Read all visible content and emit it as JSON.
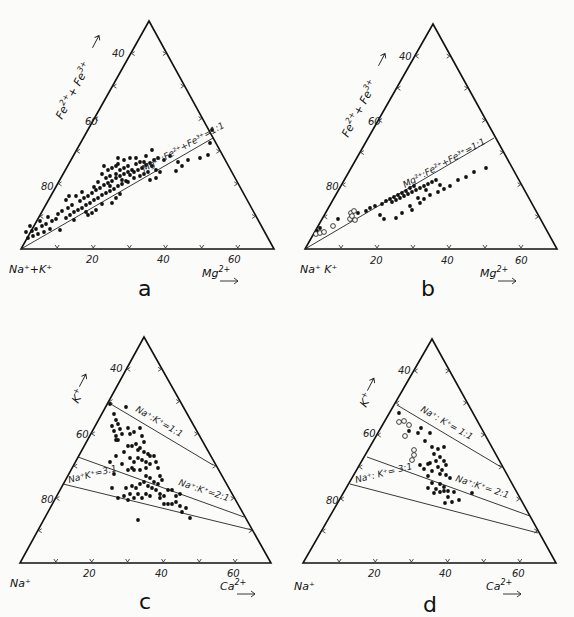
{
  "chart_data": [
    {
      "type": "scatter",
      "subtype": "ternary",
      "panel_label": "a",
      "vertices": {
        "bottom_left": "Na⁺+K⁺",
        "bottom_right": "Mg²⁺",
        "left_axis": "Fe²⁺+Fe³⁺"
      },
      "bottom_axis_label": "Mg²⁺",
      "left_axis_label": "Fe²⁺+Fe³⁺",
      "bottom_left_label": "Na⁺+K⁺",
      "bottom_ticks": [
        "20",
        "40",
        "60"
      ],
      "left_ticks": [
        "40",
        "60",
        "80"
      ],
      "reference_lines": [
        {
          "label": "Mg²⁺:Fe²⁺+Fe³⁺=1:1"
        }
      ],
      "series": [
        {
          "name": "samples",
          "marker": "filled",
          "count_approx": 120
        }
      ]
    },
    {
      "type": "scatter",
      "subtype": "ternary",
      "panel_label": "b",
      "bottom_axis_label": "Mg²⁺",
      "left_axis_label": "Fe²⁺+Fe³⁺",
      "bottom_left_label": "Na⁺  K⁺",
      "bottom_ticks": [
        "20",
        "40",
        "60"
      ],
      "left_ticks": [
        "40",
        "60",
        "80"
      ],
      "reference_lines": [
        {
          "label": "Mg²⁺:Fe²⁺+Fe³⁺=1:1"
        }
      ],
      "series": [
        {
          "name": "samples",
          "marker": "filled",
          "count_approx": 45
        },
        {
          "name": "samples (open)",
          "marker": "open",
          "count_approx": 8
        }
      ]
    },
    {
      "type": "scatter",
      "subtype": "ternary",
      "panel_label": "c",
      "bottom_axis_label": "Ca²⁺",
      "left_axis_label": "K⁺",
      "bottom_left_label": "Na⁺",
      "bottom_ticks": [
        "20",
        "40",
        "60"
      ],
      "left_ticks": [
        "40",
        "60",
        "80"
      ],
      "reference_lines": [
        {
          "label": "Na⁺:K⁺=1:1"
        },
        {
          "label": "Na⁺:K⁺=2:1"
        },
        {
          "label": "Na⁺:K⁺=3:1"
        }
      ],
      "series": [
        {
          "name": "samples",
          "marker": "filled",
          "count_approx": 110
        }
      ]
    },
    {
      "type": "scatter",
      "subtype": "ternary",
      "panel_label": "d",
      "bottom_axis_label": "Ca²⁺",
      "left_axis_label": "K⁺",
      "bottom_left_label": "Na⁺",
      "bottom_ticks": [
        "20",
        "40",
        "60"
      ],
      "left_ticks": [
        "40",
        "60",
        "80"
      ],
      "reference_lines": [
        {
          "label": "Na⁺: K⁺= 1:1"
        },
        {
          "label": "Na⁺:K⁺= 2:1"
        },
        {
          "label": "Na⁺: K⁺= 3:1"
        }
      ],
      "series": [
        {
          "name": "samples",
          "marker": "filled",
          "count_approx": 40
        },
        {
          "name": "samples (open)",
          "marker": "open",
          "count_approx": 7
        }
      ]
    }
  ],
  "labels": {
    "a": {
      "panel": "a",
      "bl": "Na⁺+K⁺",
      "br": "Mg",
      "br_sup": "2+",
      "left_main": "Fe",
      "left_sup1": "2+",
      "left_plus": "+ Fe",
      "left_sup2": "3+",
      "t20": "20",
      "t40": "40",
      "t60": "60",
      "l40": "40",
      "l60": "60",
      "l80": "80",
      "ref1": "Mg²⁺:Fe²⁺+Fe³⁺=1:1"
    },
    "b": {
      "panel": "b",
      "bl": "Na⁺  K⁺",
      "br": "Mg",
      "br_sup": "2+",
      "left_main": "Fe",
      "left_sup1": "2+",
      "left_plus": "+ Fe",
      "left_sup2": "3+",
      "t20": "20",
      "t40": "40",
      "t60": "60",
      "l40": "40",
      "l60": "60",
      "l80": "80",
      "ref1": "Mg²⁺:Fe²⁺+Fe³⁺=1:1"
    },
    "c": {
      "panel": "c",
      "bl": "Na⁺",
      "br": "Ca",
      "br_sup": "2+",
      "left_main": "K",
      "left_sup1": "+",
      "t20": "20",
      "t40": "40",
      "t60": "60",
      "l40": "40",
      "l60": "60",
      "l80": "80",
      "ref1": "Na⁺:K⁺=1:1",
      "ref2": "Na⁺:K⁺=2:1",
      "ref3": "Na⁺K⁺=3:1"
    },
    "d": {
      "panel": "d",
      "bl": "Na⁺",
      "br": "Ca",
      "br_sup": "2+",
      "left_main": "K",
      "left_sup1": "+",
      "t20": "20",
      "t40": "40",
      "t60": "60",
      "l40": "40",
      "l60": "60",
      "l80": "80",
      "ref1": "Na⁺: K⁺= 1:1",
      "ref2": "Na⁺:K⁺= 2:1",
      "ref3": "Na⁺: K⁺= 3:1"
    }
  },
  "points": {
    "a_filled": [
      [
        28,
        238
      ],
      [
        33,
        236
      ],
      [
        38,
        234
      ],
      [
        44,
        232
      ],
      [
        50,
        229
      ],
      [
        32,
        231
      ],
      [
        36,
        229
      ],
      [
        42,
        226
      ],
      [
        46,
        224
      ],
      [
        52,
        221
      ],
      [
        56,
        219
      ],
      [
        40,
        221
      ],
      [
        48,
        217
      ],
      [
        58,
        214
      ],
      [
        62,
        211
      ],
      [
        68,
        208
      ],
      [
        72,
        205
      ],
      [
        66,
        218
      ],
      [
        70,
        215
      ],
      [
        74,
        212
      ],
      [
        78,
        210
      ],
      [
        82,
        208
      ],
      [
        86,
        205
      ],
      [
        80,
        201
      ],
      [
        84,
        198
      ],
      [
        88,
        196
      ],
      [
        92,
        193
      ],
      [
        96,
        190
      ],
      [
        90,
        203
      ],
      [
        94,
        200
      ],
      [
        98,
        198
      ],
      [
        102,
        195
      ],
      [
        106,
        193
      ],
      [
        100,
        188
      ],
      [
        104,
        185
      ],
      [
        108,
        183
      ],
      [
        112,
        181
      ],
      [
        116,
        178
      ],
      [
        110,
        191
      ],
      [
        114,
        189
      ],
      [
        118,
        186
      ],
      [
        122,
        184
      ],
      [
        126,
        181
      ],
      [
        120,
        176
      ],
      [
        124,
        174
      ],
      [
        128,
        172
      ],
      [
        132,
        170
      ],
      [
        106,
        178
      ],
      [
        98,
        182
      ],
      [
        94,
        187
      ],
      [
        102,
        174
      ],
      [
        108,
        170
      ],
      [
        112,
        168
      ],
      [
        116,
        166
      ],
      [
        120,
        170
      ],
      [
        124,
        168
      ],
      [
        128,
        166
      ],
      [
        130,
        175
      ],
      [
        134,
        172
      ],
      [
        138,
        170
      ],
      [
        142,
        168
      ],
      [
        146,
        165
      ],
      [
        150,
        163
      ],
      [
        154,
        160
      ],
      [
        158,
        158
      ],
      [
        140,
        176
      ],
      [
        144,
        174
      ],
      [
        148,
        172
      ],
      [
        136,
        164
      ],
      [
        144,
        162
      ],
      [
        152,
        166
      ],
      [
        156,
        170
      ],
      [
        160,
        172
      ],
      [
        88,
        215
      ],
      [
        92,
        213
      ],
      [
        74,
        220
      ],
      [
        60,
        230
      ],
      [
        30,
        226
      ],
      [
        26,
        232
      ],
      [
        112,
        203
      ],
      [
        116,
        198
      ],
      [
        120,
        194
      ],
      [
        76,
        196
      ],
      [
        82,
        192
      ],
      [
        102,
        204
      ],
      [
        86,
        212
      ],
      [
        96,
        210
      ],
      [
        118,
        164
      ],
      [
        124,
        160
      ],
      [
        130,
        158
      ],
      [
        136,
        158
      ],
      [
        116,
        174
      ],
      [
        122,
        180
      ],
      [
        110,
        176
      ],
      [
        128,
        182
      ],
      [
        134,
        178
      ],
      [
        140,
        162
      ],
      [
        146,
        156
      ],
      [
        152,
        150
      ],
      [
        164,
        160
      ],
      [
        170,
        156
      ],
      [
        178,
        162
      ],
      [
        176,
        171
      ],
      [
        182,
        166
      ],
      [
        188,
        160
      ],
      [
        200,
        158
      ],
      [
        208,
        155
      ],
      [
        156,
        178
      ],
      [
        150,
        180
      ],
      [
        212,
        130
      ],
      [
        210,
        143
      ],
      [
        69,
        196
      ],
      [
        66,
        200
      ],
      [
        110,
        186
      ],
      [
        104,
        166
      ],
      [
        118,
        158
      ]
    ],
    "b_filled": [
      [
        317,
        231
      ],
      [
        320,
        228
      ],
      [
        338,
        219
      ],
      [
        358,
        213
      ],
      [
        366,
        211
      ],
      [
        370,
        208
      ],
      [
        375,
        206
      ],
      [
        382,
        204
      ],
      [
        386,
        201
      ],
      [
        390,
        199
      ],
      [
        394,
        197
      ],
      [
        398,
        195
      ],
      [
        402,
        193
      ],
      [
        406,
        191
      ],
      [
        410,
        188
      ],
      [
        414,
        186
      ],
      [
        392,
        202
      ],
      [
        396,
        200
      ],
      [
        400,
        198
      ],
      [
        404,
        196
      ],
      [
        408,
        194
      ],
      [
        412,
        192
      ],
      [
        416,
        190
      ],
      [
        420,
        188
      ],
      [
        424,
        186
      ],
      [
        428,
        184
      ],
      [
        432,
        182
      ],
      [
        436,
        180
      ],
      [
        380,
        215
      ],
      [
        384,
        219
      ],
      [
        396,
        218
      ],
      [
        402,
        213
      ],
      [
        412,
        210
      ],
      [
        420,
        203
      ],
      [
        424,
        199
      ],
      [
        430,
        195
      ],
      [
        438,
        192
      ],
      [
        444,
        189
      ],
      [
        450,
        186
      ],
      [
        458,
        180
      ],
      [
        466,
        177
      ],
      [
        474,
        172
      ],
      [
        486,
        168
      ],
      [
        410,
        206
      ],
      [
        418,
        198
      ],
      [
        426,
        190
      ],
      [
        440,
        185
      ]
    ],
    "b_open": [
      [
        316,
        234
      ],
      [
        320,
        233
      ],
      [
        324,
        232
      ],
      [
        333,
        226
      ],
      [
        350,
        219
      ],
      [
        351,
        213
      ],
      [
        354,
        211
      ],
      [
        355,
        220
      ],
      [
        352,
        216
      ]
    ],
    "c_filled": [
      [
        126,
        407
      ],
      [
        114,
        414
      ],
      [
        116,
        420
      ],
      [
        112,
        426
      ],
      [
        118,
        424
      ],
      [
        114,
        431
      ],
      [
        120,
        429
      ],
      [
        116,
        436
      ],
      [
        122,
        434
      ],
      [
        118,
        440
      ],
      [
        128,
        428
      ],
      [
        130,
        434
      ],
      [
        134,
        432
      ],
      [
        140,
        428
      ],
      [
        142,
        436
      ],
      [
        144,
        442
      ],
      [
        138,
        450
      ],
      [
        132,
        446
      ],
      [
        136,
        444
      ],
      [
        140,
        448
      ],
      [
        144,
        452
      ],
      [
        148,
        454
      ],
      [
        150,
        456
      ],
      [
        128,
        446
      ],
      [
        124,
        452
      ],
      [
        130,
        458
      ],
      [
        134,
        462
      ],
      [
        138,
        458
      ],
      [
        142,
        460
      ],
      [
        146,
        462
      ],
      [
        150,
        464
      ],
      [
        154,
        456
      ],
      [
        156,
        462
      ],
      [
        158,
        468
      ],
      [
        146,
        468
      ],
      [
        140,
        470
      ],
      [
        134,
        470
      ],
      [
        128,
        470
      ],
      [
        122,
        464
      ],
      [
        116,
        456
      ],
      [
        110,
        462
      ],
      [
        114,
        474
      ],
      [
        146,
        476
      ],
      [
        150,
        478
      ],
      [
        154,
        482
      ],
      [
        158,
        484
      ],
      [
        162,
        480
      ],
      [
        160,
        476
      ],
      [
        144,
        482
      ],
      [
        148,
        486
      ],
      [
        152,
        488
      ],
      [
        156,
        490
      ],
      [
        140,
        484
      ],
      [
        136,
        488
      ],
      [
        132,
        486
      ],
      [
        126,
        488
      ],
      [
        130,
        494
      ],
      [
        134,
        498
      ],
      [
        138,
        494
      ],
      [
        142,
        498
      ],
      [
        146,
        494
      ],
      [
        150,
        496
      ],
      [
        160,
        494
      ],
      [
        164,
        496
      ],
      [
        168,
        490
      ],
      [
        172,
        490
      ],
      [
        176,
        496
      ],
      [
        180,
        494
      ],
      [
        124,
        496
      ],
      [
        128,
        500
      ],
      [
        164,
        504
      ],
      [
        168,
        504
      ],
      [
        172,
        504
      ],
      [
        176,
        502
      ],
      [
        180,
        506
      ],
      [
        182,
        512
      ],
      [
        186,
        508
      ],
      [
        160,
        498
      ],
      [
        118,
        498
      ],
      [
        112,
        488
      ],
      [
        138,
        520
      ],
      [
        190,
        518
      ],
      [
        110,
        404
      ],
      [
        116,
        440
      ],
      [
        132,
        468
      ]
    ],
    "d_filled": [
      [
        399,
        413
      ],
      [
        409,
        431
      ],
      [
        421,
        428
      ],
      [
        430,
        433
      ],
      [
        418,
        433
      ],
      [
        425,
        441
      ],
      [
        432,
        447
      ],
      [
        438,
        449
      ],
      [
        444,
        447
      ],
      [
        434,
        454
      ],
      [
        440,
        457
      ],
      [
        444,
        461
      ],
      [
        436,
        461
      ],
      [
        430,
        463
      ],
      [
        438,
        467
      ],
      [
        442,
        470
      ],
      [
        446,
        465
      ],
      [
        440,
        474
      ],
      [
        446,
        475
      ],
      [
        450,
        478
      ],
      [
        428,
        464
      ],
      [
        432,
        471
      ],
      [
        420,
        465
      ],
      [
        424,
        469
      ],
      [
        428,
        476
      ],
      [
        440,
        484
      ],
      [
        444,
        491
      ],
      [
        428,
        488
      ],
      [
        432,
        483
      ],
      [
        436,
        489
      ],
      [
        440,
        492
      ],
      [
        444,
        487
      ],
      [
        448,
        491
      ],
      [
        448,
        497
      ],
      [
        454,
        492
      ],
      [
        434,
        493
      ],
      [
        445,
        503
      ],
      [
        452,
        502
      ],
      [
        459,
        500
      ],
      [
        472,
        493
      ]
    ],
    "d_open": [
      [
        399,
        422
      ],
      [
        404,
        421
      ],
      [
        409,
        425
      ],
      [
        405,
        436
      ],
      [
        414,
        450
      ],
      [
        414,
        455
      ],
      [
        412,
        460
      ]
    ]
  }
}
